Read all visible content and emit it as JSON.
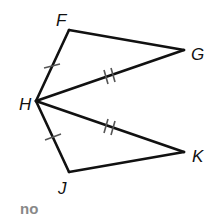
{
  "diagram": {
    "points": {
      "F": {
        "label": "F",
        "x": 69,
        "y": 30
      },
      "G": {
        "label": "G",
        "x": 184,
        "y": 50
      },
      "H": {
        "label": "H",
        "x": 36,
        "y": 101
      },
      "K": {
        "label": "K",
        "x": 184,
        "y": 152
      },
      "J": {
        "label": "J",
        "x": 69,
        "y": 172
      }
    },
    "segments": [
      {
        "from": "F",
        "to": "G",
        "marks": 0
      },
      {
        "from": "F",
        "to": "H",
        "marks": 1
      },
      {
        "from": "H",
        "to": "G",
        "marks": 2
      },
      {
        "from": "H",
        "to": "K",
        "marks": 2
      },
      {
        "from": "H",
        "to": "J",
        "marks": 1
      },
      {
        "from": "J",
        "to": "K",
        "marks": 0
      }
    ],
    "caption": "no",
    "colors": {
      "line": "#111111",
      "caption": "#888888"
    }
  }
}
